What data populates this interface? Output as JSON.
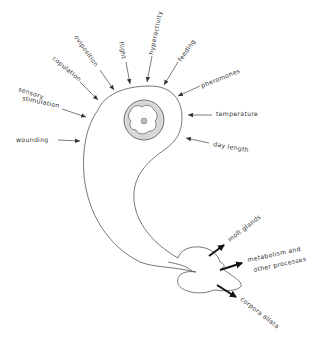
{
  "diagram": {
    "inputs": {
      "wounding": "wounding",
      "sensory_stimulation_line1": "sensory",
      "sensory_stimulation_line2": "stimulation",
      "copulation": "copulation",
      "oviposition": "oviposition",
      "flight": "flight",
      "hyperactivity": "hyperactivity",
      "feeding": "feeding",
      "pheromones": "pheromones",
      "temperature": "temperature",
      "day_length": "day length"
    },
    "outputs": {
      "molt_glands": "molt glands",
      "metabolism_line1": "metabolism  and",
      "metabolism_line2": "other processes",
      "corpora_allata": "corpora  allata"
    }
  }
}
